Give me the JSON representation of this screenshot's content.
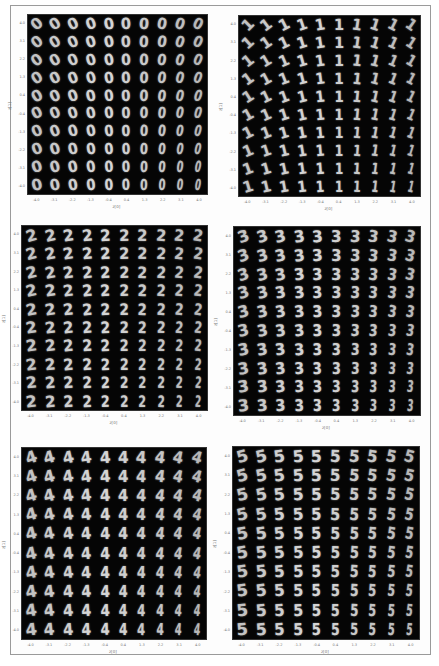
{
  "chart_data": [
    {
      "type": "heatmap",
      "title": "",
      "digit": "0",
      "grid": [
        10,
        10
      ],
      "xlabel": "z[0]",
      "ylabel": "z[1]",
      "xticks": [
        "-4.0",
        "-3.1",
        "-2.2",
        "-1.3",
        "-0.4",
        "0.4",
        "1.3",
        "2.2",
        "3.1",
        "4.0"
      ],
      "yticks": [
        "4.0",
        "3.1",
        "2.2",
        "1.3",
        "0.4",
        "-0.4",
        "-1.3",
        "-2.2",
        "-3.1",
        "-4.0"
      ],
      "glyph": "0",
      "rotation_start": -40,
      "rotation_end": 25,
      "grid_on": false
    },
    {
      "type": "heatmap",
      "title": "",
      "digit": "1",
      "grid": [
        10,
        10
      ],
      "xlabel": "z[0]",
      "ylabel": "z[1]",
      "xticks": [
        "-4.0",
        "-3.1",
        "-2.2",
        "-1.3",
        "-0.4",
        "0.4",
        "1.3",
        "2.2",
        "3.1",
        "4.0"
      ],
      "yticks": [
        "4.0",
        "3.1",
        "2.2",
        "1.3",
        "0.4",
        "-0.4",
        "-1.3",
        "-2.2",
        "-3.1",
        "-4.0"
      ],
      "glyph": "1",
      "rotation_start": -45,
      "rotation_end": 35,
      "grid_on": false
    },
    {
      "type": "heatmap",
      "title": "",
      "digit": "2",
      "grid": [
        10,
        10
      ],
      "xlabel": "z[0]",
      "ylabel": "z[1]",
      "xticks": [
        "-4.0",
        "-3.1",
        "-2.2",
        "-1.3",
        "-0.4",
        "0.4",
        "1.3",
        "2.2",
        "3.1",
        "4.0"
      ],
      "yticks": [
        "4.0",
        "3.1",
        "2.2",
        "1.3",
        "0.4",
        "-0.4",
        "-1.3",
        "-2.2",
        "-3.1",
        "-4.0"
      ],
      "glyph": "2",
      "rotation_start": -15,
      "rotation_end": 10,
      "grid_on": false
    },
    {
      "type": "heatmap",
      "title": "",
      "digit": "3",
      "grid": [
        10,
        10
      ],
      "xlabel": "z[0]",
      "ylabel": "z[1]",
      "xticks": [
        "-4.0",
        "-3.1",
        "-2.2",
        "-1.3",
        "-0.4",
        "0.4",
        "1.3",
        "2.2",
        "3.1",
        "4.0"
      ],
      "yticks": [
        "4.0",
        "3.1",
        "2.2",
        "1.3",
        "0.4",
        "-0.4",
        "-1.3",
        "-2.2",
        "-3.1",
        "-4.0"
      ],
      "glyph": "3",
      "rotation_start": -20,
      "rotation_end": 15,
      "grid_on": false
    },
    {
      "type": "heatmap",
      "title": "",
      "digit": "4",
      "grid": [
        10,
        10
      ],
      "xlabel": "z[0]",
      "ylabel": "z[1]",
      "xticks": [
        "-4.0",
        "-3.1",
        "-2.2",
        "-1.3",
        "-0.4",
        "0.4",
        "1.3",
        "2.2",
        "3.1",
        "4.0"
      ],
      "yticks": [
        "4.0",
        "3.1",
        "2.2",
        "1.3",
        "0.4",
        "-0.4",
        "-1.3",
        "-2.2",
        "-3.1",
        "-4.0"
      ],
      "glyph": "4",
      "rotation_start": -20,
      "rotation_end": 15,
      "grid_on": false
    },
    {
      "type": "heatmap",
      "title": "",
      "digit": "5",
      "grid": [
        10,
        10
      ],
      "xlabel": "z[0]",
      "ylabel": "z[1]",
      "xticks": [
        "-4.0",
        "-3.1",
        "-2.2",
        "-1.3",
        "-0.4",
        "0.4",
        "1.3",
        "2.2",
        "3.1",
        "4.0"
      ],
      "yticks": [
        "4.0",
        "3.1",
        "2.2",
        "1.3",
        "0.4",
        "-0.4",
        "-1.3",
        "-2.2",
        "-3.1",
        "-4.0"
      ],
      "glyph": "5",
      "rotation_start": -15,
      "rotation_end": 15,
      "grid_on": false
    }
  ],
  "colors": {
    "plot_background": "#050505",
    "digit_stroke": "#d8d8d8",
    "page_background": "#ffffff",
    "frame_border": "#9a9a9a",
    "tick_text": "#777777"
  }
}
